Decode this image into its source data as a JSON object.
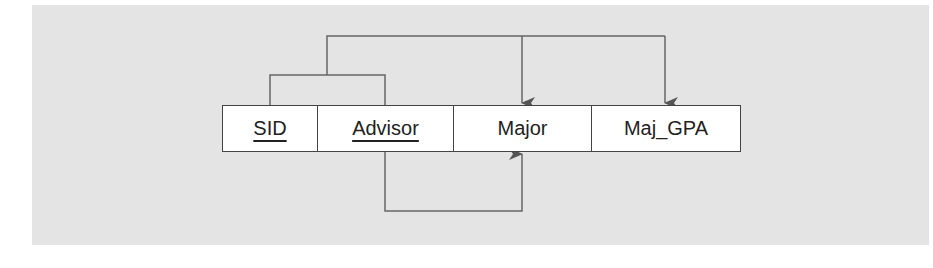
{
  "diagram": {
    "relation": {
      "attributes": [
        {
          "name": "SID",
          "is_key": true,
          "width": 95
        },
        {
          "name": "Advisor",
          "is_key": true,
          "width": 136
        },
        {
          "name": "Major",
          "is_key": false,
          "width": 138
        },
        {
          "name": "Maj_GPA",
          "is_key": false,
          "width": 148
        }
      ]
    },
    "dependencies": [
      {
        "from": [
          "SID",
          "Advisor"
        ],
        "to": [
          "Major",
          "Maj_GPA"
        ]
      },
      {
        "from": [
          "Advisor"
        ],
        "to": [
          "Major"
        ]
      }
    ],
    "colors": {
      "background_panel": "#e4e4e4",
      "line": "#555555",
      "cell_fill": "#ffffff"
    }
  }
}
